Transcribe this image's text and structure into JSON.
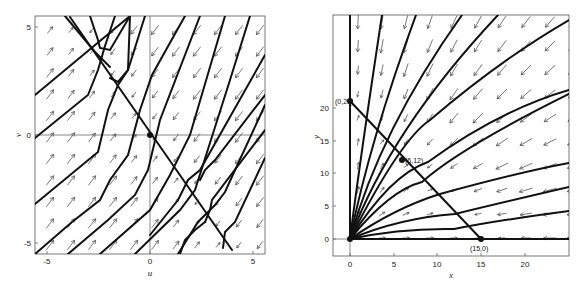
{
  "chart_data": [
    {
      "type": "line",
      "title": "",
      "description": "Phase portrait (u, v) with direction field arrows; saddle at origin with separatrix line v = -1.33u and trajectories parallel to v = u",
      "xlabel": "u",
      "ylabel": "v",
      "xlim": [
        -5.6,
        5.6
      ],
      "ylim": [
        -5.6,
        5.6
      ],
      "xticks": [
        "-5",
        "0",
        "5"
      ],
      "yticks": [
        "5",
        "0",
        "-5"
      ],
      "equilibria": [
        {
          "u": 0,
          "v": 0
        }
      ],
      "separatrix": {
        "from": [
          -3.8,
          5.6
        ],
        "to": [
          3.9,
          -5.6
        ]
      },
      "trajectory_slope": 1.33,
      "grid": false,
      "legend": null
    },
    {
      "type": "line",
      "title": "",
      "description": "Phase portrait (x, y) for first quadrant with nullcline line from (0,21) to (15,0); trajectories fan out from origin",
      "xlabel": "x",
      "ylabel": "y",
      "xlim": [
        -2,
        25
      ],
      "ylim": [
        -2.6,
        25
      ],
      "xticks": [
        "0",
        "5",
        "10",
        "15",
        "20"
      ],
      "yticks": [
        "0",
        "5",
        "10",
        "15",
        "20"
      ],
      "equilibria": [
        {
          "x": 0,
          "y": 0,
          "label": ""
        },
        {
          "x": 0,
          "y": 21,
          "label": "(0,21)"
        },
        {
          "x": 6,
          "y": 12,
          "label": "(6,12)"
        },
        {
          "x": 15,
          "y": 0,
          "label": "(15,0)"
        }
      ],
      "grid": false,
      "legend": null
    }
  ],
  "left_plot": {
    "xlabel": "u",
    "ylabel": "v",
    "xticks": [
      {
        "v": -5,
        "label": "-5"
      },
      {
        "v": 0,
        "label": "0"
      },
      {
        "v": 5,
        "label": "5"
      }
    ],
    "yticks": [
      {
        "v": 5,
        "label": "5"
      },
      {
        "v": 0,
        "label": "0"
      },
      {
        "v": -5,
        "label": "-5"
      }
    ]
  },
  "right_plot": {
    "xlabel": "x",
    "ylabel": "y",
    "xticks": [
      {
        "v": 0,
        "label": "0"
      },
      {
        "v": 5,
        "label": "5"
      },
      {
        "v": 10,
        "label": "10"
      },
      {
        "v": 15,
        "label": "15"
      },
      {
        "v": 20,
        "label": "20"
      }
    ],
    "yticks": [
      {
        "v": 0,
        "label": "0"
      },
      {
        "v": 5,
        "label": "5"
      },
      {
        "v": 10,
        "label": "10"
      },
      {
        "v": 15,
        "label": "15"
      },
      {
        "v": 20,
        "label": "20"
      }
    ],
    "point_labels": {
      "p021": "(0,21)",
      "p612": "(6,12)",
      "p150": "(15,0)"
    }
  }
}
